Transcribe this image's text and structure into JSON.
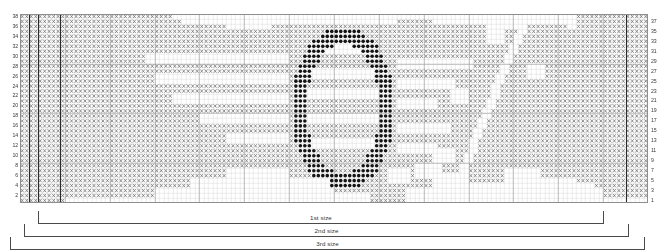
{
  "chart_data": {
    "type": "heatmap",
    "title": "",
    "grid": {
      "columns": 140,
      "rows": 38,
      "cell_width": 4.486,
      "cell_height": 4.974
    },
    "symbols": {
      "blank": {
        "name": "blank-stitch",
        "color": "#ffffff",
        "glyph": ""
      },
      "x": {
        "name": "x-stitch",
        "color": "#6b6b6b",
        "glyph": "×"
      },
      "filled": {
        "name": "filled-stitch",
        "color": "#151515",
        "glyph": "●"
      }
    },
    "colors": {
      "grid_minor": "#d8d8d8",
      "grid_major": "#9a9a9a",
      "frame": "#8e8e8e",
      "x_symbol": "#6f6f6f",
      "filled_symbol": "#141414",
      "bracket_line": "#4a4a4a",
      "label_text": "#3a3a3a",
      "background": "#ffffff"
    },
    "major_gridline_every": {
      "columns": 10,
      "rows": 10
    },
    "heavy_columns": [
      2,
      4,
      9,
      135
    ],
    "xlabel": "",
    "ylabel": "",
    "legend_position": "none",
    "grid_on": true
  },
  "row_numbers": {
    "left": [
      38,
      36,
      34,
      32,
      30,
      28,
      26,
      24,
      22,
      20,
      18,
      16,
      14,
      12,
      10,
      8,
      6,
      4,
      2
    ],
    "right": [
      37,
      35,
      33,
      31,
      29,
      27,
      25,
      23,
      21,
      19,
      17,
      15,
      13,
      11,
      9,
      7,
      5,
      3,
      1
    ]
  },
  "size_brackets": [
    {
      "label": "1st size",
      "left_px": 38,
      "right_px": 604,
      "top_px": 8
    },
    {
      "label": "2nd size",
      "left_px": 24,
      "right_px": 629,
      "top_px": 21
    },
    {
      "label": "3rd size",
      "left_px": 10,
      "right_px": 645,
      "top_px": 34
    }
  ]
}
